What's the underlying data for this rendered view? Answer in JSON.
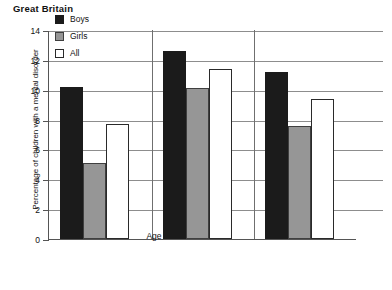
{
  "title": "Great Britain",
  "footer_fragment": "",
  "axes": {
    "ylabel": "Percentage of children with a mental disorder",
    "xlabel": "Age",
    "yticks": [
      "0",
      "2",
      "4",
      "6",
      "8",
      "10",
      "12",
      "14"
    ]
  },
  "legend": {
    "items": [
      {
        "label": "Boys",
        "color": "#1b1b1b"
      },
      {
        "label": "Girls",
        "color": "#969696"
      },
      {
        "label": "All",
        "color": "#ffffff"
      }
    ]
  },
  "chart_data": {
    "type": "bar",
    "title": "Great Britain",
    "xlabel": "Age",
    "ylabel": "Percentage of children with a mental disorder",
    "ylim": [
      0,
      14
    ],
    "ytick_step": 2,
    "grid": true,
    "legend_position": "upper-left-inside",
    "categories": [
      "5–10",
      "11–16",
      "All"
    ],
    "series": [
      {
        "name": "Boys",
        "color": "#1b1b1b",
        "values": [
          10.2,
          12.6,
          11.2
        ]
      },
      {
        "name": "Girls",
        "color": "#969696",
        "values": [
          5.1,
          10.1,
          7.6
        ]
      },
      {
        "name": "All",
        "color": "#ffffff",
        "values": [
          7.7,
          11.4,
          9.4
        ]
      }
    ]
  }
}
